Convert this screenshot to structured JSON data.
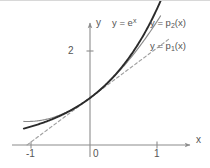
{
  "figure": {
    "background_color": "#ffffff"
  },
  "axes": {
    "x_axis_label": "x",
    "y_axis_label": "y",
    "x_ticks": [
      {
        "value": -1,
        "label": "-1"
      },
      {
        "value": 0,
        "label": "0"
      },
      {
        "value": 1,
        "label": "1"
      }
    ],
    "y_ticks": [
      {
        "value": 2,
        "label": "2"
      }
    ],
    "xlim": [
      -1.4,
      1.6
    ],
    "ylim": [
      -0.4,
      3.05
    ],
    "grid": false,
    "arrowheads": true
  },
  "curve_labels": {
    "exp": {
      "prefix": "y = e",
      "exponent": "x"
    },
    "p2": {
      "prefix": "y = p",
      "subscript": "2",
      "suffix": "(x)"
    },
    "p1": {
      "prefix": "y = p",
      "subscript": "1",
      "suffix": "(x)"
    }
  },
  "colors": {
    "exp_curve": "#2b2b2b",
    "p2_curve": "#8a8a8a",
    "p1_curve": "#a0a0a0",
    "axis": "#8c8c8c",
    "text": "#555555",
    "top_border": "#d8d8d8"
  },
  "chart_data": {
    "type": "line",
    "xlabel": "x",
    "ylabel": "y",
    "xlim": [
      -1.4,
      1.6
    ],
    "ylim": [
      -0.4,
      3.05
    ],
    "grid": false,
    "legend": "inline-labels",
    "xticks": [
      -1,
      0,
      1
    ],
    "xticklabels": [
      "-1",
      "0",
      "1"
    ],
    "yticks": [
      2
    ],
    "yticklabels": [
      "2"
    ],
    "x": [
      -1.0,
      -0.9,
      -0.8,
      -0.7,
      -0.6,
      -0.5,
      -0.4,
      -0.3,
      -0.2,
      -0.1,
      0.0,
      0.1,
      0.2,
      0.3,
      0.4,
      0.5,
      0.6,
      0.7,
      0.8,
      0.9,
      1.0,
      1.1,
      1.2
    ],
    "series": [
      {
        "name": "y = e^x",
        "style": "solid",
        "width": "thick",
        "color": "#2b2b2b",
        "x_range": [
          -1.05,
          1.12
        ],
        "values": [
          0.368,
          0.407,
          0.449,
          0.497,
          0.549,
          0.607,
          0.67,
          0.741,
          0.819,
          0.905,
          1.0,
          1.105,
          1.221,
          1.35,
          1.492,
          1.649,
          1.822,
          2.014,
          2.226,
          2.46,
          2.718,
          3.004,
          3.32
        ]
      },
      {
        "name": "y = p_2(x)",
        "style": "solid",
        "width": "thin",
        "color": "#8a8a8a",
        "expression": "1 + x + x^2/2",
        "x_range": [
          -1.05,
          1.12
        ],
        "values": [
          0.5,
          0.505,
          0.52,
          0.545,
          0.58,
          0.625,
          0.68,
          0.745,
          0.82,
          0.905,
          1.0,
          1.105,
          1.22,
          1.345,
          1.48,
          1.625,
          1.78,
          1.945,
          2.12,
          2.305,
          2.5,
          2.705,
          2.92
        ]
      },
      {
        "name": "y = p_1(x)",
        "style": "dashed",
        "width": "thin",
        "color": "#a0a0a0",
        "expression": "1 + x",
        "x_range": [
          -1.0,
          1.25
        ],
        "values": [
          0.0,
          0.1,
          0.2,
          0.3,
          0.4,
          0.5,
          0.6,
          0.7,
          0.8,
          0.9,
          1.0,
          1.1,
          1.2,
          1.3,
          1.4,
          1.5,
          1.6,
          1.7,
          1.8,
          1.9,
          2.0,
          2.1,
          2.2
        ]
      }
    ],
    "annotations": [
      {
        "text": "y = e^x",
        "x": 0.35,
        "y": 2.95
      },
      {
        "text": "y = p_2(x)",
        "x": 0.95,
        "y": 2.9
      },
      {
        "text": "y = p_1(x)",
        "x": 0.95,
        "y": 2.4
      }
    ]
  }
}
